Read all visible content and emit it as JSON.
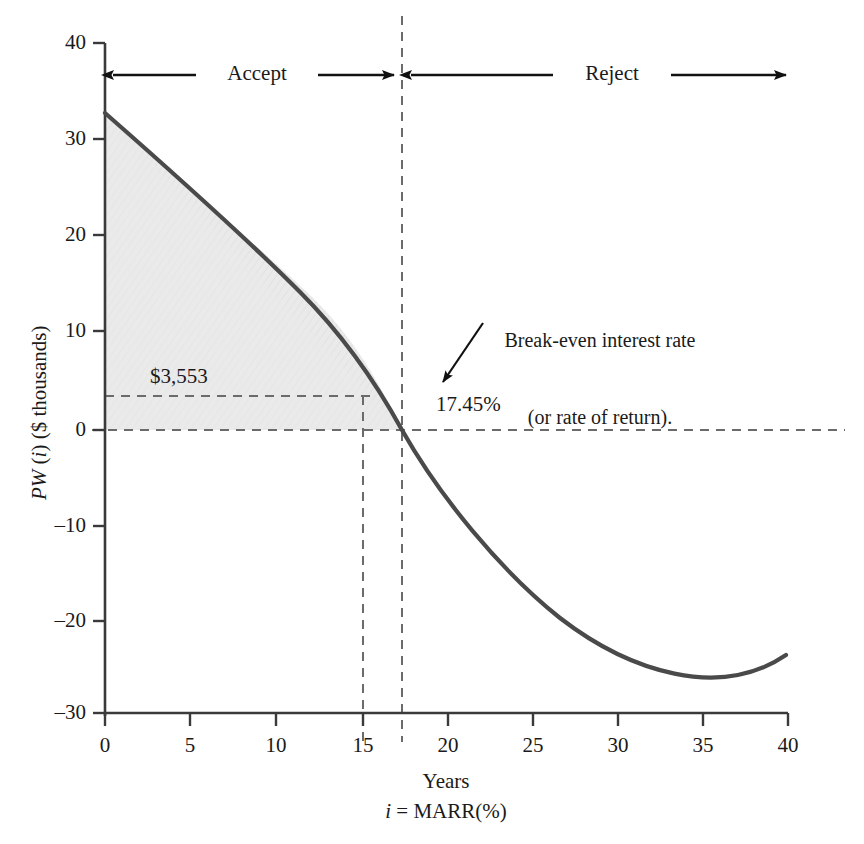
{
  "figure": {
    "background": "#ffffff",
    "curve_color": "#4a4a4a",
    "shade_color": "#e9e9e9",
    "axis_color": "#3a3a3a",
    "dash_color": "#6b6b6b"
  },
  "axes": {
    "x": {
      "label": "Years",
      "sublabel_html": "<em class=\"it\">i</em> = MARR(%)",
      "sublabel_text": "i = MARR(%)",
      "min": 0,
      "max": 40,
      "ticks": [
        0,
        5,
        10,
        15,
        20,
        25,
        30,
        35,
        40
      ],
      "tick_labels": [
        "0",
        "5",
        "10",
        "15",
        "20",
        "25",
        "30",
        "35",
        "40"
      ]
    },
    "y": {
      "label_html": "<em class=\"it\">PW</em> (<em class=\"it\">i</em>) ($ thousands)",
      "label_text": "PW (i) ($ thousands)",
      "min": -30,
      "max": 40,
      "ticks": [
        40,
        30,
        20,
        10,
        0,
        -10,
        -20,
        -30
      ],
      "tick_labels": [
        "40",
        "30",
        "20",
        "10",
        "0",
        "–10",
        "–20",
        "–30"
      ]
    }
  },
  "regions": {
    "accept_label": "Accept",
    "reject_label": "Reject",
    "boundary_value": 17.45
  },
  "annotations": {
    "pw_value_label": "$3,553",
    "pw_value": 3.553,
    "marr_marker": 15,
    "breakeven_label": "17.45%",
    "breakeven_value": 17.45,
    "callout_line1": "Break-even interest rate",
    "callout_line2": "(or rate of return)."
  },
  "chart_data": {
    "type": "line",
    "title": "",
    "xlabel": "Years  /  i = MARR(%)",
    "ylabel": "PW (i) ($ thousands)",
    "xlim": [
      0,
      40
    ],
    "ylim": [
      -30,
      40
    ],
    "grid": false,
    "legend": "none",
    "series": [
      {
        "name": "PW(i)",
        "x": [
          0,
          2,
          4,
          6,
          8,
          10,
          12,
          14,
          15,
          16,
          17.45,
          18,
          20,
          22,
          24,
          26,
          28,
          30,
          32,
          34,
          36,
          38,
          40
        ],
        "y": [
          33.0,
          29.0,
          25.1,
          21.3,
          17.6,
          14.0,
          10.5,
          7.0,
          5.3,
          3.6,
          0.0,
          -1.0,
          -4.2,
          -7.4,
          -10.4,
          -13.2,
          -15.8,
          -18.2,
          -20.4,
          -22.4,
          -24.2,
          -25.8,
          -27.0
        ]
      }
    ],
    "shaded_region": {
      "description": "Accept region: area between PW(i) curve and PW = 0, from i = 0 to i = 17.45",
      "x_from": 0,
      "x_to": 17.45,
      "fill": "#e9e9e9"
    },
    "reference_lines": [
      {
        "type": "horizontal",
        "value": 0,
        "style": "dashed"
      },
      {
        "type": "horizontal",
        "value": 3.553,
        "style": "dashed",
        "label": "$3,553"
      },
      {
        "type": "vertical",
        "value": 15,
        "style": "dashed"
      },
      {
        "type": "vertical",
        "value": 17.45,
        "style": "dashed",
        "label": "17.45%"
      }
    ],
    "annotations": [
      {
        "text": "Accept",
        "x_range": [
          0,
          17.45
        ],
        "y": 36.5,
        "type": "double-arrow-span"
      },
      {
        "text": "Reject",
        "x_range": [
          17.45,
          40
        ],
        "y": 36.5,
        "type": "double-arrow-span"
      },
      {
        "text": "Break-even interest rate (or rate of return).",
        "points_to_x": 17.45,
        "points_to_y": 0,
        "type": "arrow-callout"
      }
    ]
  }
}
